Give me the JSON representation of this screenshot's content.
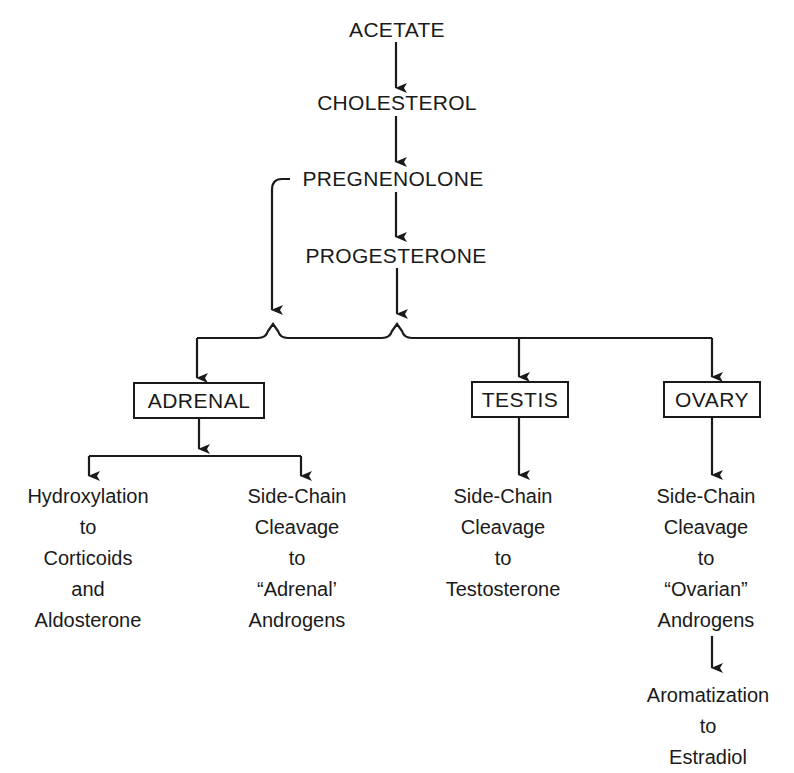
{
  "diagram": {
    "type": "flowchart",
    "title": "",
    "pathway": {
      "acetate": "ACETATE",
      "cholesterol": "CHOLESTEROL",
      "pregnenolone": "PREGNENOLONE",
      "progesterone": "PROGESTERONE"
    },
    "organs": {
      "adrenal": "ADRENAL",
      "testis": "TESTIS",
      "ovary": "OVARY"
    },
    "outcomes": {
      "adrenal_hydroxylation": [
        "Hydroxylation",
        "to",
        "Corticoids",
        "and",
        "Aldosterone"
      ],
      "adrenal_sidechain": [
        "Side-Chain",
        "Cleavage",
        "to",
        "“Adrenal’",
        "Androgens"
      ],
      "testis_sidechain": [
        "Side-Chain",
        "Cleavage",
        "to",
        "Testosterone"
      ],
      "ovary_sidechain": [
        "Side-Chain",
        "Cleavage",
        "to",
        "“Ovarian”",
        "Androgens"
      ],
      "ovary_aromatization": [
        "Aromatization",
        "to",
        "Estradiol"
      ]
    },
    "edges": [
      [
        "ACETATE",
        "CHOLESTEROL"
      ],
      [
        "CHOLESTEROL",
        "PREGNENOLONE"
      ],
      [
        "PREGNENOLONE",
        "PROGESTERONE"
      ],
      [
        "PREGNENOLONE",
        "ADRENAL/TESTIS/OVARY"
      ],
      [
        "PROGESTERONE",
        "ADRENAL/TESTIS/OVARY"
      ],
      [
        "ADRENAL",
        "Hydroxylation to Corticoids and Aldosterone"
      ],
      [
        "ADRENAL",
        "Side-Chain Cleavage to Adrenal Androgens"
      ],
      [
        "TESTIS",
        "Side-Chain Cleavage to Testosterone"
      ],
      [
        "OVARY",
        "Side-Chain Cleavage to Ovarian Androgens"
      ],
      [
        "Ovarian Androgens",
        "Aromatization to Estradiol"
      ]
    ],
    "colors": {
      "ink": "#1a1a1a",
      "background": "#ffffff"
    }
  }
}
